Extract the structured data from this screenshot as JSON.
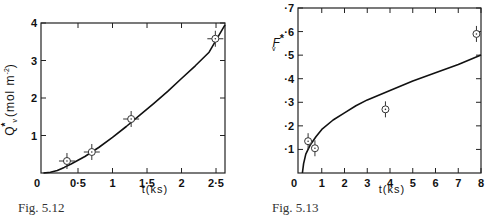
{
  "chart_data": [
    {
      "id": "fig-5-12",
      "type": "line",
      "title": "",
      "caption": "Fig. 5.12",
      "xlabel": "t(ks)",
      "ylabel": "Q*v (mol m⁻²)",
      "ylabel_parts": {
        "main": "Q",
        "sup": "*",
        "sub": "v",
        "units": "(mol m",
        "units_sup": "-2",
        "units_close": ")"
      },
      "xlim": [
        0,
        2.63
      ],
      "ylim": [
        0,
        4
      ],
      "x_ticks": [
        0,
        0.5,
        1,
        1.5,
        2,
        2.5
      ],
      "x_tick_labels": [
        "0",
        "0·5",
        "1",
        "1·5",
        "2",
        "2·5"
      ],
      "y_ticks": [
        1,
        2,
        3,
        4
      ],
      "y_tick_labels": [
        "1",
        "2",
        "3",
        "4"
      ],
      "grid": false,
      "legend": null,
      "series": [
        {
          "name": "model curve",
          "kind": "line",
          "x": [
            0,
            0.1,
            0.2,
            0.3,
            0.4,
            0.5,
            0.6,
            0.7,
            0.8,
            1.0,
            1.2,
            1.4,
            1.6,
            1.8,
            2.0,
            2.2,
            2.4,
            2.63
          ],
          "y": [
            0,
            0.02,
            0.07,
            0.15,
            0.24,
            0.34,
            0.44,
            0.56,
            0.68,
            0.95,
            1.24,
            1.55,
            1.86,
            2.18,
            2.52,
            2.86,
            3.22,
            3.95
          ]
        },
        {
          "name": "experimental",
          "kind": "scatter",
          "marker": "open-circle-with-error-bars",
          "x": [
            0.34,
            0.7,
            1.27,
            2.49
          ],
          "y": [
            0.32,
            0.56,
            1.44,
            3.58
          ]
        }
      ]
    },
    {
      "id": "fig-5-13",
      "type": "line",
      "title": "",
      "caption": "Fig. 5.13",
      "xlabel": "t(ks)",
      "ylabel": "F*v",
      "ylabel_parts": {
        "main": "F",
        "sup": "*",
        "sub": "v"
      },
      "xlim": [
        0,
        8
      ],
      "ylim": [
        0,
        0.7
      ],
      "x_ticks": [
        0,
        1,
        2,
        3,
        4,
        5,
        6,
        7,
        8
      ],
      "x_tick_labels": [
        "0",
        "1",
        "2",
        "3",
        "4",
        "5",
        "6",
        "7",
        "8"
      ],
      "y_ticks": [
        0.1,
        0.2,
        0.3,
        0.4,
        0.5,
        0.6,
        0.7
      ],
      "y_tick_labels": [
        "·1",
        "·2",
        "·3",
        "·4",
        "·5",
        "·6",
        "·7"
      ],
      "grid": false,
      "legend": null,
      "series": [
        {
          "name": "model curve",
          "kind": "line",
          "x": [
            0.15,
            0.2,
            0.3,
            0.5,
            0.75,
            1,
            1.5,
            2,
            2.5,
            3,
            4,
            5,
            6,
            7,
            8
          ],
          "y": [
            0,
            0.04,
            0.08,
            0.12,
            0.155,
            0.185,
            0.225,
            0.255,
            0.285,
            0.31,
            0.35,
            0.39,
            0.425,
            0.46,
            0.5
          ]
        },
        {
          "name": "experimental",
          "kind": "scatter",
          "marker": "open-circle-with-error-bars",
          "x": [
            0.4,
            0.7,
            3.8,
            7.8
          ],
          "y": [
            0.135,
            0.105,
            0.27,
            0.59
          ]
        }
      ]
    }
  ]
}
